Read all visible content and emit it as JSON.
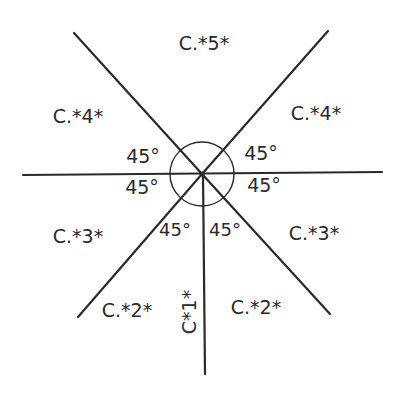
{
  "diagram": {
    "type": "radial-sector-labels",
    "center": [
      202,
      174
    ],
    "ink_color": "#2a2a2a",
    "background": "#ffffff",
    "lines": [
      {
        "name": "line-upper-left",
        "from": [
          74,
          33
        ],
        "to": [
          202,
          174
        ]
      },
      {
        "name": "line-upper-right",
        "from": [
          328,
          31
        ],
        "to": [
          202,
          174
        ]
      },
      {
        "name": "line-horizontal",
        "from": [
          23,
          175
        ],
        "to": [
          382,
          172
        ]
      },
      {
        "name": "line-lower-left",
        "from": [
          78,
          317
        ],
        "to": [
          202,
          174
        ]
      },
      {
        "name": "line-lower-right",
        "from": [
          330,
          314
        ],
        "to": [
          202,
          174
        ]
      },
      {
        "name": "line-vertical-down",
        "from": [
          203,
          174
        ],
        "to": [
          205,
          374
        ]
      }
    ],
    "arc_radius": 32,
    "sector_labels": {
      "top": "C.*5*",
      "upper_left": "C.*4*",
      "upper_right": "C.*4*",
      "lower_left": "C.*3*",
      "lower_right": "C.*3*",
      "bottom_left": "C.*2*",
      "bottom_right": "C.*2*",
      "bottom_vertical": "C*1*"
    },
    "angle_labels": {
      "upper_left": "45°",
      "upper_right": "45°",
      "mid_left": "45°",
      "mid_right": "45°",
      "lower_left": "45°",
      "lower_right": "45°"
    }
  }
}
